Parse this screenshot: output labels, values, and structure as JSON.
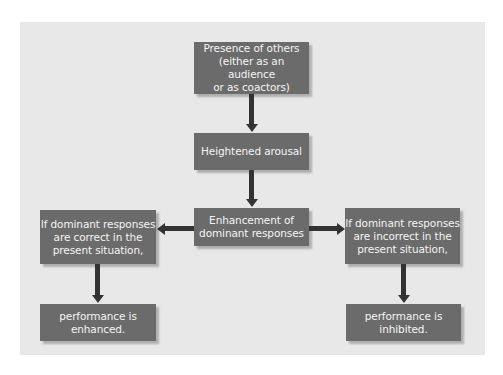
{
  "diagram": {
    "title": "",
    "nodes": {
      "presence": "Presence of others\n(either as an audience\nor as coactors)",
      "arousal": "Heightened arousal",
      "enhancement": "Enhancement of\ndominant responses",
      "correct": "If dominant responses\nare correct in the\npresent situation,",
      "incorrect": "If dominant responses\nare incorrect in the\npresent situation,",
      "enhanced": "performance is\nenhanced.",
      "inhibited": "performance is\ninhibited."
    },
    "edges": [
      {
        "from": "presence",
        "to": "arousal"
      },
      {
        "from": "arousal",
        "to": "enhancement"
      },
      {
        "from": "enhancement",
        "to": "correct"
      },
      {
        "from": "enhancement",
        "to": "incorrect"
      },
      {
        "from": "correct",
        "to": "enhanced"
      },
      {
        "from": "incorrect",
        "to": "inhibited"
      }
    ],
    "colors": {
      "panel": "#e8e8e8",
      "box": "#6b6b6b",
      "box_text": "#f4f4f4",
      "arrow": "#333333"
    }
  }
}
